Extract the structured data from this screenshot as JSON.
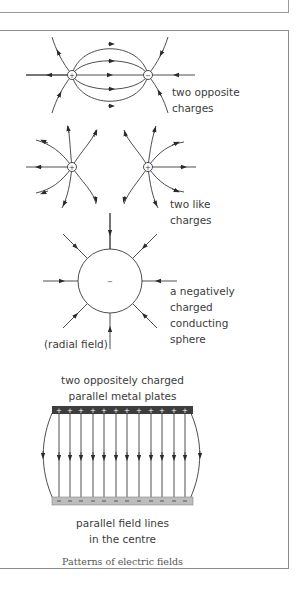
{
  "figure": {
    "caption": "Patterns of electric fields",
    "panels": [
      {
        "id": "opposite",
        "label_lines": [
          "two opposite",
          "charges"
        ],
        "charges": [
          {
            "sign": "+",
            "x": 72,
            "y": 75
          },
          {
            "sign": "−",
            "x": 148,
            "y": 75
          }
        ]
      },
      {
        "id": "like",
        "label_lines": [
          "two like",
          "charges"
        ],
        "charges": [
          {
            "sign": "+",
            "x": 72,
            "y": 167
          },
          {
            "sign": "+",
            "x": 148,
            "y": 167
          }
        ]
      },
      {
        "id": "sphere",
        "label_lines": [
          "a negatively",
          "charged",
          "conducting",
          "sphere"
        ],
        "note": "(radial field)",
        "sphere_sign": "−"
      },
      {
        "id": "plates",
        "title_lines": [
          "two oppositely charged",
          "parallel metal plates"
        ],
        "label_lines": [
          "parallel field lines",
          "in the centre"
        ],
        "top_plate_sign": "+",
        "bottom_plate_sign": "−",
        "plate_colors": {
          "top": "#3d3d3d",
          "bottom": "#bdbdbd"
        }
      }
    ]
  }
}
